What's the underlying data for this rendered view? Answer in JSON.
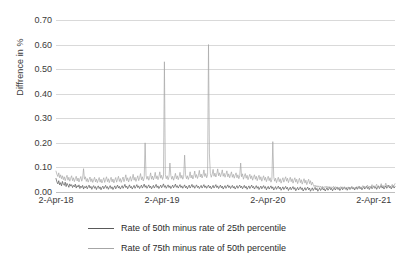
{
  "chart_data": {
    "type": "line",
    "title": "",
    "xlabel": "",
    "ylabel": "Diffrence in %",
    "ylim": [
      0.0,
      0.7
    ],
    "ytick_labels": [
      "0.70",
      "0.60",
      "0.50",
      "0.40",
      "0.30",
      "0.20",
      "0.10",
      "0.00"
    ],
    "ytick_values": [
      0.7,
      0.6,
      0.5,
      0.4,
      0.3,
      0.2,
      0.1,
      0.0
    ],
    "xtick_labels": [
      "2-Apr-18",
      "2-Apr-19",
      "2-Apr-20",
      "2-Apr-21"
    ],
    "xtick_positions": [
      0.0,
      0.3125,
      0.625,
      0.9375
    ],
    "grid": true,
    "legend_position": "bottom",
    "series": [
      {
        "name": "Rate of 50th minus rate of 25th percentile",
        "color": "#595959",
        "values": [
          0.055,
          0.041,
          0.033,
          0.046,
          0.029,
          0.038,
          0.025,
          0.043,
          0.031,
          0.027,
          0.04,
          0.022,
          0.035,
          0.028,
          0.019,
          0.033,
          0.024,
          0.03,
          0.018,
          0.027,
          0.021,
          0.032,
          0.016,
          0.026,
          0.02,
          0.029,
          0.014,
          0.024,
          0.018,
          0.027,
          0.012,
          0.022,
          0.017,
          0.025,
          0.013,
          0.021,
          0.028,
          0.016,
          0.023,
          0.011,
          0.02,
          0.026,
          0.015,
          0.022,
          0.01,
          0.019,
          0.025,
          0.014,
          0.021,
          0.009,
          0.018,
          0.024,
          0.013,
          0.02,
          0.027,
          0.015,
          0.022,
          0.011,
          0.019,
          0.026,
          0.014,
          0.021,
          0.01,
          0.018,
          0.025,
          0.013,
          0.02,
          0.028,
          0.016,
          0.023,
          0.012,
          0.019,
          0.026,
          0.015,
          0.022,
          0.031,
          0.018,
          0.024,
          0.013,
          0.021,
          0.029,
          0.017,
          0.023,
          0.012,
          0.02,
          0.027,
          0.015,
          0.022,
          0.03,
          0.018,
          0.025,
          0.014,
          0.021,
          0.028,
          0.016,
          0.023,
          0.032,
          0.019,
          0.026,
          0.015,
          0.022,
          0.029,
          0.017,
          0.024,
          0.013,
          0.02,
          0.027,
          0.016,
          0.023,
          0.031,
          0.018,
          0.025,
          0.014,
          0.021,
          0.028,
          0.017,
          0.024,
          0.033,
          0.019,
          0.026,
          0.015,
          0.022,
          0.029,
          0.018,
          0.025,
          0.014,
          0.021,
          0.028,
          0.017,
          0.024,
          0.032,
          0.019,
          0.026,
          0.016,
          0.023,
          0.03,
          0.018,
          0.025,
          0.015,
          0.022,
          0.029,
          0.017,
          0.024,
          0.013,
          0.021,
          0.028,
          0.016,
          0.023,
          0.031,
          0.019,
          0.026,
          0.015,
          0.022,
          0.029,
          0.018,
          0.024,
          0.014,
          0.021,
          0.027,
          0.016,
          0.023,
          0.03,
          0.018,
          0.025,
          0.015,
          0.022,
          0.028,
          0.017,
          0.024,
          0.013,
          0.02,
          0.027,
          0.016,
          0.023,
          0.03,
          0.018,
          0.025,
          0.014,
          0.021,
          0.028,
          0.017,
          0.024,
          0.012,
          0.02,
          0.026,
          0.015,
          0.022,
          0.029,
          0.018,
          0.025,
          0.014,
          0.021,
          0.027,
          0.016,
          0.023,
          0.012,
          0.019,
          0.026,
          0.015,
          0.022,
          0.028,
          0.017,
          0.024,
          0.013,
          0.02,
          0.027,
          0.016,
          0.023,
          0.011,
          0.018,
          0.025,
          0.014,
          0.021,
          0.028,
          0.017,
          0.023,
          0.012,
          0.019,
          0.026,
          0.015,
          0.022,
          0.01,
          0.017,
          0.024,
          0.013,
          0.02,
          0.026,
          0.015,
          0.022,
          0.009,
          0.016,
          0.023,
          0.012,
          0.019,
          0.025,
          0.014,
          0.021,
          0.008,
          0.015,
          0.022,
          0.011,
          0.018,
          0.024,
          0.013,
          0.02,
          0.007,
          0.014,
          0.021,
          0.01,
          0.017,
          0.023,
          0.012,
          0.019,
          0.006,
          0.013,
          0.02,
          0.009,
          0.016,
          0.022,
          0.011,
          0.018,
          0.005,
          0.012,
          0.019,
          0.008,
          0.015,
          0.021,
          0.01,
          0.017,
          0.004,
          0.011,
          0.018,
          0.007,
          0.014,
          0.02,
          0.009,
          0.016,
          0.003,
          0.01,
          0.017,
          0.006,
          0.013,
          0.019,
          0.008,
          0.015,
          0.003,
          0.01,
          0.016,
          0.006,
          0.012,
          0.018,
          0.008,
          0.014,
          0.004,
          0.011,
          0.017,
          0.007,
          0.013,
          0.019,
          0.009,
          0.015,
          0.005,
          0.012,
          0.018,
          0.008,
          0.014,
          0.02,
          0.01,
          0.016,
          0.006,
          0.013,
          0.019,
          0.009,
          0.015,
          0.021,
          0.011,
          0.017,
          0.007,
          0.014,
          0.02,
          0.01,
          0.016,
          0.022,
          0.012,
          0.018,
          0.008,
          0.015,
          0.021,
          0.011,
          0.017,
          0.023,
          0.013,
          0.019,
          0.009,
          0.016,
          0.022,
          0.012,
          0.018,
          0.024,
          0.014,
          0.02,
          0.01,
          0.017,
          0.023,
          0.013,
          0.019,
          0.025,
          0.015,
          0.021,
          0.011,
          0.018,
          0.024,
          0.014,
          0.02,
          0.026,
          0.016,
          0.022,
          0.012,
          0.019,
          0.025,
          0.015,
          0.021,
          0.027,
          0.017,
          0.023,
          0.013,
          0.02,
          0.026,
          0.016,
          0.022
        ]
      },
      {
        "name": "Rate of 75th minus rate of 50th percentile",
        "color": "#a6a6a6",
        "values": [
          0.085,
          0.072,
          0.063,
          0.078,
          0.058,
          0.07,
          0.054,
          0.066,
          0.05,
          0.062,
          0.046,
          0.058,
          0.068,
          0.048,
          0.06,
          0.044,
          0.056,
          0.066,
          0.046,
          0.058,
          0.042,
          0.054,
          0.064,
          0.045,
          0.057,
          0.041,
          0.053,
          0.063,
          0.044,
          0.056,
          0.095,
          0.052,
          0.062,
          0.043,
          0.055,
          0.04,
          0.051,
          0.061,
          0.042,
          0.054,
          0.039,
          0.05,
          0.06,
          0.041,
          0.053,
          0.038,
          0.049,
          0.059,
          0.04,
          0.052,
          0.037,
          0.048,
          0.058,
          0.039,
          0.051,
          0.062,
          0.042,
          0.054,
          0.038,
          0.05,
          0.06,
          0.041,
          0.053,
          0.037,
          0.049,
          0.059,
          0.04,
          0.052,
          0.064,
          0.043,
          0.055,
          0.039,
          0.051,
          0.061,
          0.042,
          0.054,
          0.07,
          0.046,
          0.058,
          0.041,
          0.053,
          0.063,
          0.044,
          0.056,
          0.072,
          0.048,
          0.06,
          0.043,
          0.055,
          0.066,
          0.046,
          0.058,
          0.075,
          0.05,
          0.062,
          0.045,
          0.057,
          0.2,
          0.068,
          0.052,
          0.064,
          0.048,
          0.06,
          0.078,
          0.052,
          0.065,
          0.049,
          0.061,
          0.08,
          0.054,
          0.066,
          0.05,
          0.062,
          0.082,
          0.056,
          0.068,
          0.051,
          0.063,
          0.53,
          0.07,
          0.054,
          0.066,
          0.05,
          0.062,
          0.118,
          0.068,
          0.052,
          0.064,
          0.048,
          0.06,
          0.076,
          0.054,
          0.066,
          0.05,
          0.062,
          0.08,
          0.056,
          0.068,
          0.052,
          0.064,
          0.15,
          0.07,
          0.054,
          0.066,
          0.051,
          0.063,
          0.082,
          0.057,
          0.069,
          0.053,
          0.065,
          0.085,
          0.059,
          0.071,
          0.055,
          0.067,
          0.088,
          0.061,
          0.073,
          0.057,
          0.069,
          0.09,
          0.063,
          0.075,
          0.058,
          0.07,
          0.6,
          0.155,
          0.076,
          0.06,
          0.072,
          0.092,
          0.064,
          0.077,
          0.061,
          0.073,
          0.094,
          0.066,
          0.078,
          0.062,
          0.074,
          0.09,
          0.064,
          0.076,
          0.06,
          0.072,
          0.086,
          0.062,
          0.074,
          0.058,
          0.07,
          0.082,
          0.06,
          0.072,
          0.056,
          0.068,
          0.078,
          0.058,
          0.07,
          0.054,
          0.066,
          0.118,
          0.062,
          0.074,
          0.052,
          0.064,
          0.075,
          0.056,
          0.068,
          0.05,
          0.062,
          0.072,
          0.054,
          0.066,
          0.048,
          0.06,
          0.07,
          0.052,
          0.064,
          0.046,
          0.058,
          0.068,
          0.05,
          0.062,
          0.044,
          0.056,
          0.066,
          0.048,
          0.06,
          0.042,
          0.054,
          0.064,
          0.046,
          0.058,
          0.04,
          0.052,
          0.205,
          0.062,
          0.044,
          0.056,
          0.038,
          0.05,
          0.06,
          0.042,
          0.054,
          0.036,
          0.048,
          0.058,
          0.04,
          0.052,
          0.062,
          0.044,
          0.056,
          0.038,
          0.05,
          0.06,
          0.042,
          0.054,
          0.036,
          0.048,
          0.058,
          0.04,
          0.052,
          0.034,
          0.046,
          0.056,
          0.038,
          0.05,
          0.032,
          0.044,
          0.054,
          0.036,
          0.048,
          0.03,
          0.042,
          0.052,
          0.034,
          0.046,
          0.028,
          0.04,
          0.03,
          0.022,
          0.028,
          0.02,
          0.026,
          0.019,
          0.025,
          0.018,
          0.024,
          0.017,
          0.023,
          0.016,
          0.022,
          0.018,
          0.024,
          0.017,
          0.023,
          0.016,
          0.022,
          0.015,
          0.021,
          0.017,
          0.023,
          0.016,
          0.022,
          0.015,
          0.021,
          0.014,
          0.02,
          0.016,
          0.022,
          0.015,
          0.021,
          0.014,
          0.02,
          0.013,
          0.019,
          0.015,
          0.021,
          0.014,
          0.02,
          0.013,
          0.019,
          0.012,
          0.018,
          0.014,
          0.02,
          0.013,
          0.019,
          0.022,
          0.015,
          0.021,
          0.014,
          0.02,
          0.026,
          0.017,
          0.023,
          0.015,
          0.021,
          0.028,
          0.018,
          0.024,
          0.016,
          0.022,
          0.03,
          0.019,
          0.025,
          0.017,
          0.023,
          0.032,
          0.02,
          0.026,
          0.018,
          0.024,
          0.034,
          0.021,
          0.027,
          0.019,
          0.025,
          0.036,
          0.022,
          0.028,
          0.02,
          0.026,
          0.015,
          0.023,
          0.031,
          0.018,
          0.026,
          0.034
        ]
      }
    ]
  },
  "legend": {
    "items": [
      {
        "label": "Rate of 50th minus rate of 25th percentile",
        "color": "#595959"
      },
      {
        "label": "Rate of 75th minus rate of 50th percentile",
        "color": "#a6a6a6"
      }
    ]
  }
}
